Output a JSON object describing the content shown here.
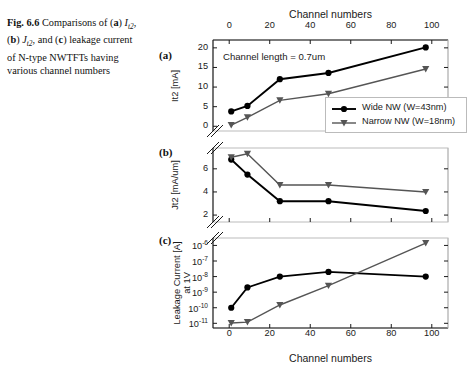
{
  "caption": {
    "label": "Fig. 6.6",
    "text_part1": "Comparisons of (",
    "a_bold": "a",
    "close1": ") ",
    "sym1": "I",
    "sym1_sub": "t2",
    "mid1": ", (",
    "b_bold": "b",
    "close2": ") ",
    "sym2": "J",
    "sym2_sub": "t2",
    "mid2": ", and (",
    "c_bold": "c",
    "close3": ") leakage current of N-type NWTFTs having various channel numbers",
    "full_text": "Fig. 6.6 Comparisons of (a) It2, (b) Jt2, and (c) leakage current of N-type NWTFTs having various channel numbers"
  },
  "figure": {
    "panel_a_letter": "(a)",
    "panel_b_letter": "(b)",
    "panel_c_letter": "(c)",
    "top_axis_title": "Channel numbers",
    "bottom_axis_title": "Channel numbers",
    "annotation_a": "Channel length = 0.7um",
    "legend": {
      "items": [
        {
          "label": "Wide NW (W=43nm)",
          "marker": "circle-filled",
          "color": "#000000"
        },
        {
          "label": "Narrow NW (W=18nm)",
          "marker": "triangle-down-filled",
          "color": "#555555"
        }
      ]
    },
    "colors": {
      "wide_nw": "#000000",
      "narrow_nw": "#555555",
      "axis": "#1a1a1a",
      "grid": "#bbbbbb",
      "background": "#ffffff"
    }
  },
  "chart_data": [
    {
      "id": "panel-a",
      "type": "line",
      "panel": "(a)",
      "title": "",
      "xlabel": "Channel numbers",
      "ylabel": "It2 [mA]",
      "xlim": [
        -8,
        108
      ],
      "ylim": [
        -1.2,
        22
      ],
      "xticks": [
        0,
        20,
        40,
        60,
        80,
        100
      ],
      "yticks": [
        0,
        5,
        10,
        15,
        20
      ],
      "xtick_labels": [
        "0",
        "20",
        "40",
        "60",
        "80",
        "100"
      ],
      "ytick_labels": [
        "0",
        "5",
        "10",
        "15",
        "20"
      ],
      "x_axis_position": "top",
      "grid": false,
      "axis_break": "y-bottom",
      "annotation": "Channel length = 0.7um",
      "legend_position": "lower-right",
      "x": [
        1,
        9,
        25,
        49,
        97
      ],
      "series": [
        {
          "name": "Wide NW (W=43nm)",
          "marker": "circle-filled",
          "color": "#000000",
          "values": [
            3.8,
            5.2,
            12.0,
            13.6,
            20.1
          ]
        },
        {
          "name": "Narrow NW (W=18nm)",
          "marker": "triangle-down-filled",
          "color": "#555555",
          "values": [
            0.3,
            2.3,
            6.6,
            8.3,
            14.6
          ]
        }
      ]
    },
    {
      "id": "panel-b",
      "type": "line",
      "panel": "(b)",
      "title": "",
      "xlabel": "",
      "ylabel": "Jt2 [mA/um]",
      "xlim": [
        -8,
        108
      ],
      "ylim": [
        1.4,
        7.8
      ],
      "xticks": [
        0,
        20,
        40,
        60,
        80,
        100
      ],
      "yticks": [
        2,
        4,
        6
      ],
      "xtick_labels": [
        "",
        "",
        "",
        "",
        "",
        ""
      ],
      "ytick_labels": [
        "2",
        "4",
        "6"
      ],
      "grid": false,
      "axis_break": "y-both",
      "legend_position": "none",
      "x": [
        1,
        9,
        25,
        49,
        97
      ],
      "series": [
        {
          "name": "Wide NW (W=43nm)",
          "marker": "circle-filled",
          "color": "#000000",
          "values": [
            6.8,
            5.5,
            3.2,
            3.2,
            2.35
          ]
        },
        {
          "name": "Narrow NW (W=18nm)",
          "marker": "triangle-down-filled",
          "color": "#555555",
          "values": [
            7.0,
            7.3,
            4.6,
            4.6,
            4.0
          ]
        }
      ]
    },
    {
      "id": "panel-c",
      "type": "line",
      "panel": "(c)",
      "title": "",
      "xlabel": "Channel numbers",
      "ylabel": "Leakage Current [A] at 1V",
      "yscale": "log",
      "xlim": [
        -8,
        108
      ],
      "ylim": [
        5e-12,
        3e-06
      ],
      "xticks": [
        0,
        20,
        40,
        60,
        80,
        100
      ],
      "yticks": [
        1e-11,
        1e-10,
        1e-09,
        1e-08,
        1e-07,
        1e-06
      ],
      "xtick_labels": [
        "0",
        "20",
        "40",
        "60",
        "80",
        "100"
      ],
      "ytick_labels": [
        "10-11",
        "10-10",
        "10-9",
        "10-8",
        "10-7",
        "10-6"
      ],
      "ytick_mantissa": "10",
      "ytick_exponents": [
        "-11",
        "-10",
        "-9",
        "-8",
        "-7",
        "-6"
      ],
      "x_axis_position": "bottom",
      "grid": false,
      "axis_break": "y-top",
      "legend_position": "none",
      "x": [
        1,
        9,
        25,
        49,
        97
      ],
      "series": [
        {
          "name": "Wide NW (W=43nm)",
          "marker": "circle-filled",
          "color": "#000000",
          "values": [
            1e-10,
            2e-09,
            1e-08,
            2e-08,
            1e-08
          ]
        },
        {
          "name": "Narrow NW (W=18nm)",
          "marker": "triangle-down-filled",
          "color": "#555555",
          "values": [
            1.05e-11,
            1.2e-11,
            1.5e-10,
            2.6e-09,
            1.4e-06
          ]
        }
      ]
    }
  ]
}
